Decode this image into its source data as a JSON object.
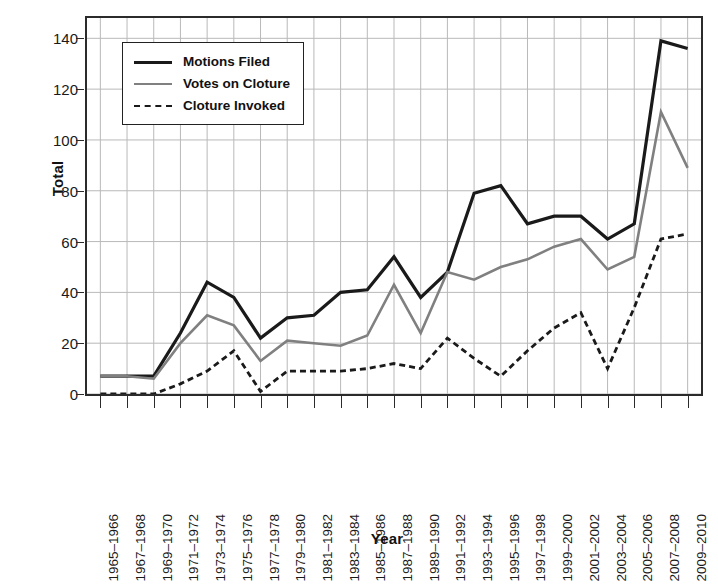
{
  "chart_data": {
    "type": "line",
    "title": "",
    "xlabel": "Year",
    "ylabel": "Total",
    "ylim": [
      0,
      148
    ],
    "yticks": [
      0,
      20,
      40,
      60,
      80,
      100,
      120,
      140
    ],
    "grid": true,
    "legend_position": "top-left",
    "categories": [
      "1965–1966",
      "1967–1968",
      "1969–1970",
      "1971–1972",
      "1973–1974",
      "1975–1976",
      "1977–1978",
      "1979–1980",
      "1981–1982",
      "1983–1984",
      "1985–1986",
      "1987–1988",
      "1989–1990",
      "1991–1992",
      "1993–1994",
      "1995–1996",
      "1997–1998",
      "1999–2000",
      "2001–2002",
      "2003–2004",
      "2005–2006",
      "2007–2008",
      "2009–2010"
    ],
    "series": [
      {
        "name": "Motions Filed",
        "color": "#1a1a1a",
        "style": "solid",
        "width": 3.2,
        "values": [
          7,
          7,
          7,
          24,
          44,
          38,
          22,
          30,
          31,
          40,
          41,
          54,
          38,
          48,
          79,
          82,
          67,
          70,
          70,
          61,
          67,
          139,
          136
        ]
      },
      {
        "name": "Votes on Cloture",
        "color": "#808080",
        "style": "solid",
        "width": 2.6,
        "values": [
          7,
          7,
          6,
          20,
          31,
          27,
          13,
          21,
          20,
          19,
          23,
          43,
          24,
          48,
          45,
          50,
          53,
          58,
          61,
          49,
          54,
          111,
          89
        ]
      },
      {
        "name": "Cloture Invoked",
        "color": "#1a1a1a",
        "style": "dashed",
        "width": 2.8,
        "values": [
          0,
          0,
          0,
          4,
          9,
          17,
          1,
          9,
          9,
          9,
          10,
          12,
          10,
          22,
          14,
          7,
          17,
          26,
          32,
          10,
          34,
          61,
          63
        ]
      }
    ]
  },
  "legend": {
    "items": [
      {
        "label": "Motions Filed",
        "swatch": "solid-thick-black"
      },
      {
        "label": "Votes on Cloture",
        "swatch": "solid-gray"
      },
      {
        "label": "Cloture Invoked",
        "swatch": "dashed-black"
      }
    ]
  },
  "colors": {
    "motions_filed": "#1a1a1a",
    "votes_on_cloture": "#808080",
    "cloture_invoked": "#1a1a1a",
    "grid": "#b9b9b9",
    "frame": "#2b2b2b",
    "background": "#ffffff"
  }
}
